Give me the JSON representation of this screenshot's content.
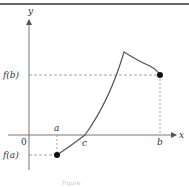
{
  "diagram": {
    "axes": {
      "x_label": "x",
      "y_label": "y",
      "origin_label": "0"
    },
    "x_ticks": [
      {
        "label": "a",
        "x": 57
      },
      {
        "label": "c",
        "x": 85
      },
      {
        "label": "b",
        "x": 160
      }
    ],
    "y_ticks": [
      {
        "label": "f(b)",
        "y": 75
      },
      {
        "label": "f(a)",
        "y": 155
      }
    ],
    "points": [
      {
        "name": "a-fa",
        "x": 57,
        "y": 155
      },
      {
        "name": "b-fb",
        "x": 160,
        "y": 75
      }
    ],
    "curve_description": "Curve rising from (a, f(a)) through x-axis at c to a cusp peak, then decreasing to (b, f(b))",
    "colors": {
      "axis": "#777777",
      "curve": "#555555",
      "dashed": "#888888",
      "point": "#111111",
      "border": "#666666"
    },
    "caption": "Figure"
  }
}
